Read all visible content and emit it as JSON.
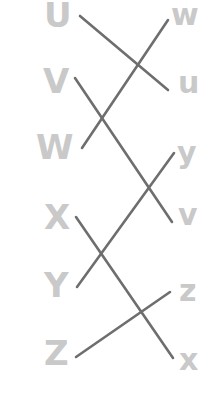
{
  "diagram": {
    "type": "matching-lines",
    "colors": {
      "label": "#c9c9c9",
      "line": "#6e6e6e",
      "background": "#ffffff"
    },
    "left": [
      {
        "label": "U",
        "x": 44,
        "y": -2
      },
      {
        "label": "V",
        "x": 43,
        "y": 64
      },
      {
        "label": "W",
        "x": 36,
        "y": 130
      },
      {
        "label": "X",
        "x": 44,
        "y": 200
      },
      {
        "label": "Y",
        "x": 44,
        "y": 268
      },
      {
        "label": "Z",
        "x": 44,
        "y": 336
      }
    ],
    "right": [
      {
        "label": "w",
        "x": 171,
        "y": 0
      },
      {
        "label": "u",
        "x": 178,
        "y": 68
      },
      {
        "label": "y",
        "x": 177,
        "y": 138
      },
      {
        "label": "v",
        "x": 178,
        "y": 200
      },
      {
        "label": "z",
        "x": 179,
        "y": 276
      },
      {
        "label": "x",
        "x": 179,
        "y": 345
      }
    ],
    "connections": [
      {
        "from": "U",
        "to": "u",
        "x1": 80,
        "y1": 16,
        "x2": 168,
        "y2": 90
      },
      {
        "from": "V",
        "to": "v",
        "x1": 75,
        "y1": 78,
        "x2": 172,
        "y2": 222
      },
      {
        "from": "W",
        "to": "w",
        "x1": 82,
        "y1": 148,
        "x2": 168,
        "y2": 20
      },
      {
        "from": "X",
        "to": "x",
        "x1": 76,
        "y1": 217,
        "x2": 173,
        "y2": 358
      },
      {
        "from": "Y",
        "to": "y",
        "x1": 77,
        "y1": 287,
        "x2": 174,
        "y2": 153
      },
      {
        "from": "Z",
        "to": "z",
        "x1": 76,
        "y1": 357,
        "x2": 170,
        "y2": 292
      }
    ]
  }
}
